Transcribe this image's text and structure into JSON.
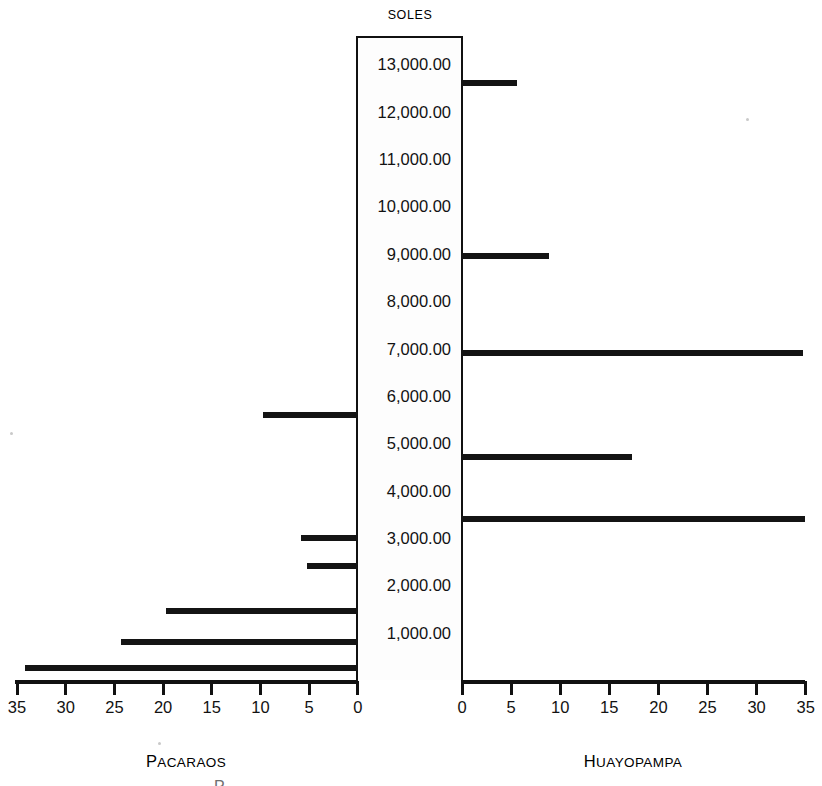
{
  "chart_data": {
    "type": "bar",
    "title": "SOLES",
    "orientation": "horizontal-diverging",
    "xlabel": "",
    "ylabel": "SOLES",
    "grid": false,
    "legend_position": "none",
    "y_tick_labels": [
      "13,000.00",
      "12,000.00",
      "11,000.00",
      "10,000.00",
      "9,000.00",
      "8,000.00",
      "7,000.00",
      "6,000.00",
      "5,000.00",
      "4,000.00",
      "3,000.00",
      "2,000.00",
      "1,000.00"
    ],
    "x_tick_labels_left": [
      "35",
      "30",
      "25",
      "20",
      "15",
      "10",
      "5",
      "0"
    ],
    "x_tick_labels_right": [
      "0",
      "5",
      "10",
      "15",
      "20",
      "25",
      "30",
      "35"
    ],
    "xlim_left": [
      35,
      0
    ],
    "xlim_right": [
      0,
      35
    ],
    "series": [
      {
        "name": "PACARAOS",
        "side": "left",
        "values": [
          {
            "level": 5600,
            "value": 9.8
          },
          {
            "level": 3000,
            "value": 5.9
          },
          {
            "level": 2400,
            "value": 5.2
          },
          {
            "level": 1450,
            "value": 19.7
          },
          {
            "level": 800,
            "value": 24.3
          },
          {
            "level": 250,
            "value": 34.2
          }
        ]
      },
      {
        "name": "HUAYOPAMPA",
        "side": "right",
        "values": [
          {
            "level": 12600,
            "value": 5.7
          },
          {
            "level": 8950,
            "value": 9.0
          },
          {
            "level": 6900,
            "value": 34.8
          },
          {
            "level": 4700,
            "value": 17.4
          },
          {
            "level": 3400,
            "value": 35.0
          }
        ]
      }
    ]
  },
  "axis": {
    "left_caption_first": "P",
    "left_caption_rest": "ACARAOS",
    "right_caption_first": "H",
    "right_caption_rest": "UAYOPAMPA"
  },
  "artifact": {
    "clipped_glyph": "P"
  }
}
